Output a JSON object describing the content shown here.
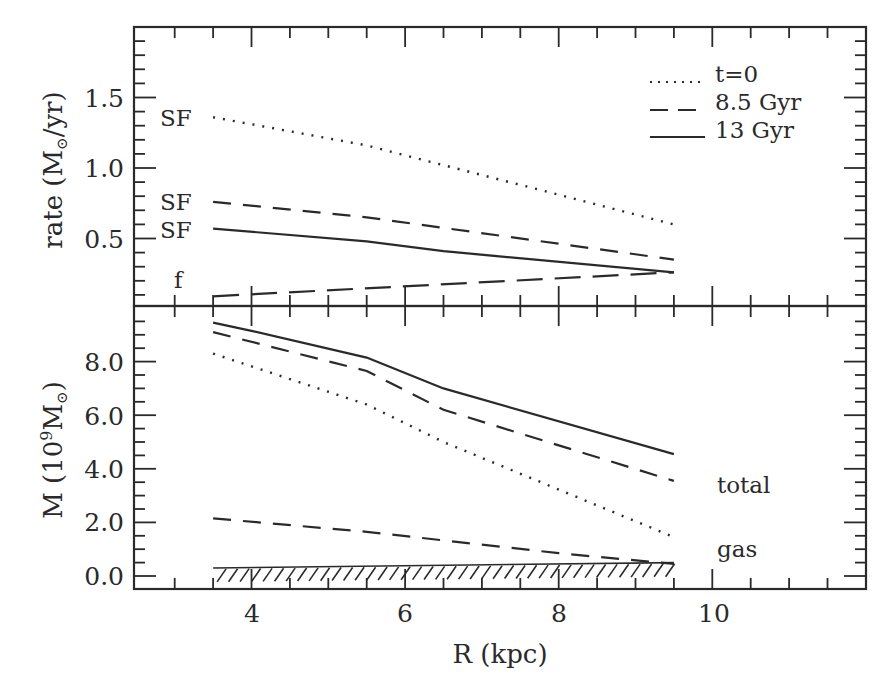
{
  "chart_data": [
    {
      "panel": "top",
      "type": "line",
      "title": "",
      "xlabel": "R (kpc)",
      "ylabel": "rate (M☉/yr)",
      "xlim": [
        2.5,
        11.9
      ],
      "ylim": [
        0.0,
        1.98
      ],
      "yticks": [
        0.5,
        1.0,
        1.5
      ],
      "ytick_labels": [
        "0.5",
        "1.0",
        "1.5"
      ],
      "grid": false,
      "legend": {
        "position": "upper right",
        "entries": [
          {
            "label": "t=0",
            "style": "dotted"
          },
          {
            "label": "8.5 Gyr",
            "style": "dashed"
          },
          {
            "label": "13 Gyr",
            "style": "solid"
          }
        ]
      },
      "series": [
        {
          "name": "SF t=0",
          "label": "SF",
          "style": "dotted",
          "x": [
            3.5,
            5.5,
            9.5
          ],
          "y": [
            1.36,
            1.16,
            0.6
          ]
        },
        {
          "name": "SF 8.5 Gyr",
          "label": "SF",
          "style": "dashed",
          "x": [
            3.5,
            5.5,
            9.5
          ],
          "y": [
            0.76,
            0.65,
            0.35
          ]
        },
        {
          "name": "SF 13 Gyr",
          "label": "SF",
          "style": "solid",
          "x": [
            3.5,
            5.5,
            6.5,
            9.5
          ],
          "y": [
            0.57,
            0.48,
            0.41,
            0.26
          ]
        },
        {
          "name": "f",
          "label": "f",
          "style": "long-dashed",
          "x": [
            3.5,
            9.5
          ],
          "y": [
            0.09,
            0.26
          ]
        }
      ]
    },
    {
      "panel": "bottom",
      "type": "line",
      "title": "",
      "xlabel": "R (kpc)",
      "ylabel": "M (10⁹M☉)",
      "xlim": [
        2.5,
        11.9
      ],
      "ylim": [
        -0.45,
        10.0
      ],
      "xticks": [
        4,
        6,
        8,
        10
      ],
      "xtick_labels": [
        "4",
        "6",
        "8",
        "10"
      ],
      "yticks": [
        0.0,
        2.0,
        4.0,
        6.0,
        8.0
      ],
      "ytick_labels": [
        "0.0",
        "2.0",
        "4.0",
        "6.0",
        "8.0"
      ],
      "grid": false,
      "annotations": [
        "total",
        "gas"
      ],
      "series": [
        {
          "name": "total 13 Gyr",
          "style": "solid",
          "x": [
            3.5,
            4.0,
            5.5,
            6.5,
            9.5
          ],
          "y": [
            9.45,
            9.15,
            8.15,
            7.0,
            4.55
          ]
        },
        {
          "name": "total 8.5 Gyr",
          "style": "dashed",
          "x": [
            3.5,
            5.5,
            6.5,
            9.5
          ],
          "y": [
            9.1,
            7.65,
            6.2,
            3.55
          ]
        },
        {
          "name": "total t=0",
          "style": "dotted",
          "x": [
            3.5,
            5.5,
            6.5,
            9.5
          ],
          "y": [
            8.3,
            6.4,
            5.0,
            1.45
          ]
        },
        {
          "name": "gas 8.5 Gyr",
          "style": "dashed",
          "x": [
            3.5,
            5.5,
            8.0,
            9.5
          ],
          "y": [
            2.15,
            1.65,
            0.85,
            0.45
          ]
        },
        {
          "name": "gas 13 Gyr",
          "style": "hatched",
          "x": [
            3.5,
            9.5
          ],
          "y": [
            0.3,
            0.5
          ]
        }
      ]
    }
  ],
  "labels": {
    "top_ylabel": "rate (M",
    "top_ylabel_tail": "/yr)",
    "bottom_ylabel_head": "M (10",
    "bottom_ylabel_exp": "9",
    "bottom_ylabel_m": "M",
    "bottom_ylabel_tail": ")",
    "xlabel": "R (kpc)",
    "sun": "⊙",
    "sf": "SF",
    "f": "f",
    "total": "total",
    "gas": "gas",
    "legend_t0": "t=0",
    "legend_85": "8.5 Gyr",
    "legend_13": "13 Gyr",
    "top_ticks": [
      "0.5",
      "1.0",
      "1.5"
    ],
    "bottom_ticks": [
      "0.0",
      "2.0",
      "4.0",
      "6.0",
      "8.0"
    ],
    "x_ticks": [
      "4",
      "6",
      "8",
      "10"
    ]
  }
}
